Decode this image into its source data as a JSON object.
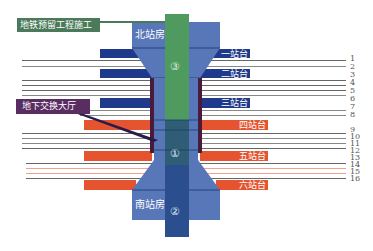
{
  "callouts": {
    "subway_reserved": "地铁预留工程施工",
    "underground_hall": "地下交换大厅"
  },
  "buildings": {
    "north_station_house": "北站房",
    "south_station_house": "南站房"
  },
  "zones": {
    "zone_1": "①",
    "zone_2": "②",
    "zone_3": "③"
  },
  "platforms": [
    {
      "label": "一站台",
      "color": "#1f3a8a"
    },
    {
      "label": "二站台",
      "color": "#1f3a8a"
    },
    {
      "label": "三站台",
      "color": "#1f3a8a"
    },
    {
      "label": "四站台",
      "color": "#e5532f"
    },
    {
      "label": "五站台",
      "color": "#e5532f"
    },
    {
      "label": "六站台",
      "color": "#e5532f"
    }
  ],
  "tracks": [
    "1",
    "2",
    "3",
    "4",
    "5",
    "6",
    "7",
    "8",
    "9",
    "10",
    "11",
    "12",
    "13",
    "14",
    "15",
    "16"
  ],
  "colors": {
    "green": "#4f9a5f",
    "green_label": "#4a7a5a",
    "light_blue": "#5877b8",
    "dark_blue": "#1f3a8a",
    "navy_column": "#2a4e8e",
    "teal": "#2e5d75",
    "red": "#e5532f",
    "purple_label": "#5a2d62",
    "maroon": "#4a1a3a"
  }
}
